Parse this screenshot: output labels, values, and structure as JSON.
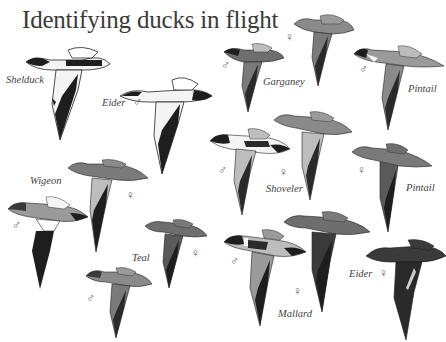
{
  "title": "Identifying ducks in flight",
  "symbols": {
    "male": "♂",
    "female": "♀"
  },
  "species": [
    {
      "name": "Shelduck",
      "birds": [
        {
          "sex": ""
        }
      ]
    },
    {
      "name": "Eider",
      "birds": [
        {
          "sex": "male"
        },
        {
          "sex": "female"
        }
      ],
      "labels": [
        "Eider ♂",
        "Eider ♀"
      ]
    },
    {
      "name": "Garganey",
      "birds": [
        {
          "sex": "male"
        },
        {
          "sex": "female"
        }
      ]
    },
    {
      "name": "Pintail",
      "birds": [
        {
          "sex": "male"
        },
        {
          "sex": "female"
        }
      ]
    },
    {
      "name": "Shoveler",
      "birds": [
        {
          "sex": "male"
        },
        {
          "sex": "female"
        }
      ]
    },
    {
      "name": "Wigeon",
      "birds": [
        {
          "sex": "male"
        },
        {
          "sex": "female"
        }
      ]
    },
    {
      "name": "Teal",
      "birds": [
        {
          "sex": "male"
        },
        {
          "sex": "female"
        }
      ]
    },
    {
      "name": "Mallard",
      "birds": [
        {
          "sex": "male"
        },
        {
          "sex": "female"
        }
      ]
    }
  ],
  "labels": {
    "shelduck": "Shelduck",
    "eider_male": "Eider",
    "eider_female": "Eider",
    "garganey": "Garganey",
    "pintail_top": "Pintail",
    "pintail_bottom": "Pintail",
    "shoveler": "Shoveler",
    "wigeon": "Wigeon",
    "teal": "Teal",
    "mallard": "Mallard"
  },
  "colors": {
    "background": "#ffffff",
    "text": "#3a3a3a",
    "dark_plumage": "#1e1e1e",
    "mid_plumage": "#6e6e6e",
    "light_plumage": "#bdbdbd",
    "white_plumage": "#f4f4f4"
  }
}
